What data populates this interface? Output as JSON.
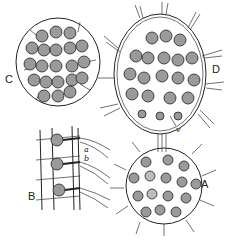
{
  "figure": {
    "type": "biological illustration",
    "panels": [
      {
        "id": "A",
        "label": "A",
        "description": "spherical colony with paired cells and radiating flagella"
      },
      {
        "id": "B",
        "label": "B",
        "description": "section of colony wall with three cells and connecting strands",
        "annotations": [
          "a",
          "b"
        ]
      },
      {
        "id": "C",
        "label": "C",
        "description": "colony with daughter cell clusters in grid arrangement"
      },
      {
        "id": "D",
        "label": "D",
        "description": "oval colony with rows of cells and flagella",
        "annotations": [
          "v"
        ]
      }
    ]
  },
  "labels": {
    "A": "A",
    "B": "B",
    "C": "C",
    "D": "D",
    "a": "a",
    "b": "b",
    "v": "v"
  }
}
